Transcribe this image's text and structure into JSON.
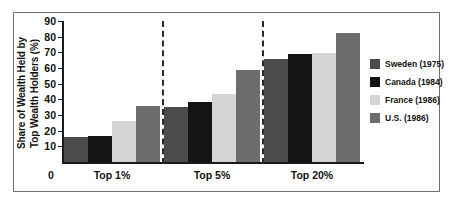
{
  "chart_data": {
    "type": "bar",
    "title": "",
    "xlabel": "",
    "ylabel": "Share of Wealth Held by Top Wealth Holders (%)",
    "ylabel_line1": "Share of Wealth Held by",
    "ylabel_line2": "Top Wealth Holders (%)",
    "categories": [
      "Top 1%",
      "Top 5%",
      "Top 20%"
    ],
    "ylim": [
      0,
      90
    ],
    "ytick_labels": [
      "90",
      "80",
      "70",
      "60",
      "50",
      "40",
      "30",
      "20",
      "10"
    ],
    "ytick_values": [
      90,
      80,
      70,
      60,
      50,
      40,
      30,
      20,
      10
    ],
    "origin_label": "0",
    "grid": false,
    "legend_position": "right",
    "series": [
      {
        "name": "Sweden (1975)",
        "color": "#4b4b4b",
        "values": [
          16,
          35,
          65.5
        ]
      },
      {
        "name": "Canada (1984)",
        "color": "#141414",
        "values": [
          16.5,
          38,
          69
        ]
      },
      {
        "name": "France (1986)",
        "color": "#d5d5d5",
        "values": [
          26,
          43.5,
          69.5
        ]
      },
      {
        "name": "U.S. (1986)",
        "color": "#6d6d6d",
        "values": [
          36,
          58.5,
          82.5
        ]
      }
    ],
    "separators": [
      "between Top 1% and Top 5%",
      "between Top 5% and Top 20%"
    ]
  },
  "frame": {
    "border_color": "#6f6f6f"
  }
}
